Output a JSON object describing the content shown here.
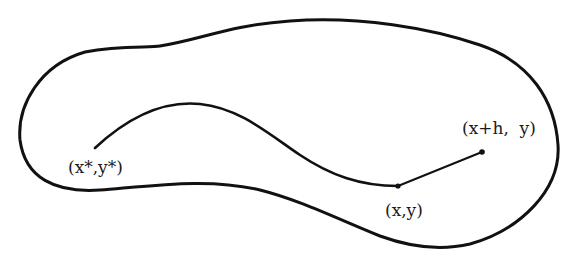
{
  "diagram": {
    "type": "region-with-path",
    "region": {
      "description": "closed region boundary",
      "stroke": "#111111"
    },
    "path": {
      "description": "curve from (x*,y*) to (x,y), then straight segment to (x+h, y)",
      "stroke": "#111111"
    },
    "points": [
      {
        "id": "start",
        "label": "(x*,y*)",
        "px": [
          95,
          148
        ]
      },
      {
        "id": "current",
        "label": "(x,y)",
        "px": [
          398,
          186
        ]
      },
      {
        "id": "step",
        "label": "(x+h,  y)",
        "px": [
          482,
          152
        ]
      }
    ]
  }
}
